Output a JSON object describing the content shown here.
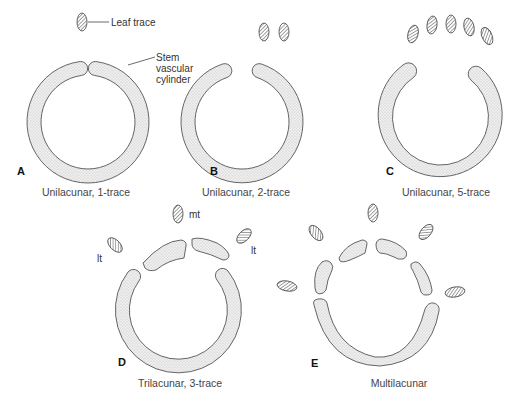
{
  "figure": {
    "panels": [
      {
        "id": "A",
        "letter": "A",
        "caption": "Unilacunar, 1-trace",
        "traces": 1,
        "gaps": 1
      },
      {
        "id": "B",
        "letter": "B",
        "caption": "Unilacunar, 2-trace",
        "traces": 2,
        "gaps": 1
      },
      {
        "id": "C",
        "letter": "C",
        "caption": "Unilacunar, 5-trace",
        "traces": 5,
        "gaps": 1
      },
      {
        "id": "D",
        "letter": "D",
        "caption": "Trilacunar, 3-trace",
        "traces": 3,
        "gaps": 3
      },
      {
        "id": "E",
        "letter": "E",
        "caption": "Multilacunar",
        "traces": 5,
        "gaps": 5
      }
    ],
    "annotations": {
      "leaf_trace": "Leaf trace",
      "stem_line1": "Stem",
      "stem_line2": "vascular",
      "stem_line3": "cylinder",
      "median_trace": "mt",
      "lateral_trace_left": "lt",
      "lateral_trace_right": "lt"
    },
    "colors": {
      "stroke": "#555555",
      "fill": "#e6e6e6",
      "hatch": "#666666"
    }
  }
}
